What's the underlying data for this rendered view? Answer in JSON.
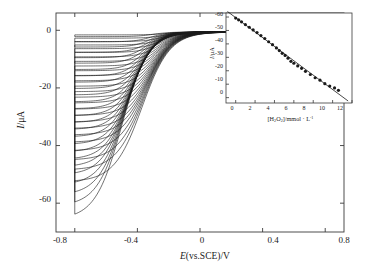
{
  "figure": {
    "kind": "cyclic-voltammogram-with-inset-calibration",
    "background": "#ffffff",
    "line_color": "#1a1a1a",
    "axis_color": "#3a3a3a"
  },
  "main_axes": {
    "xlabel_parts": {
      "italic": "E",
      "rest": "(vs.SCE)/V"
    },
    "ylabel_parts": {
      "italic": "I",
      "rest": "/μA"
    },
    "x_ticks": [
      "-0.8",
      "-0.4",
      "0",
      "0.4",
      "0.8"
    ],
    "x_tick_values": [
      -0.8,
      -0.4,
      0,
      0.4,
      0.8
    ],
    "y_ticks": [
      "0",
      "-20",
      "-40",
      "-60"
    ],
    "y_tick_values": [
      0,
      -20,
      -40,
      -60
    ],
    "xlim": [
      -0.92,
      0.92
    ],
    "ylim": [
      -70,
      6
    ],
    "grid": false,
    "frame": "box"
  },
  "inset_axes": {
    "xlabel_parts": {
      "pre": "[H",
      "sub1": "2",
      "mid": "O",
      "sub2": "2",
      "post": "]/mmol · L",
      "sup": "-1"
    },
    "ylabel_parts": {
      "italic": "I",
      "rest": "/μA"
    },
    "x_ticks": [
      "0",
      "2",
      "4",
      "6",
      "8",
      "10",
      "12"
    ],
    "x_tick_values": [
      0,
      2,
      4,
      6,
      8,
      10,
      12
    ],
    "y_ticks": [
      "0",
      "-10",
      "-20",
      "-30",
      "-40",
      "-50",
      "-60"
    ],
    "y_tick_values": [
      0,
      -10,
      -20,
      -30,
      -40,
      -50,
      -60
    ],
    "xlim": [
      -1.0,
      12.0
    ],
    "ylim": [
      -64,
      3
    ],
    "grid": false,
    "frame": "box"
  },
  "chart_data": [
    {
      "type": "line",
      "name": "cyclic-voltammograms",
      "title": "",
      "xlabel": "E(vs.SCE)/V",
      "ylabel": "I/μA",
      "xlim": [
        -0.92,
        0.92
      ],
      "ylim": [
        -70,
        6
      ],
      "grid": false,
      "legend": "none",
      "description": "Overlaid cyclic voltammetry curves of increasing cathodic peak current with successive additions of H2O2; each curve is a closed loop scanned from +0.85 V to -0.8 V and back.",
      "n_curves": 26,
      "scan_start_v": 0.85,
      "scan_switch_v": -0.8,
      "curve_peak_currents_ua": [
        -1.6,
        -3.4,
        -5.2,
        -7.0,
        -8.9,
        -10.8,
        -13.0,
        -15.2,
        -17.4,
        -19.6,
        -21.8,
        -24.2,
        -26.6,
        -29.0,
        -31.4,
        -33.8,
        -36.4,
        -39.0,
        -41.6,
        -44.2,
        -46.8,
        -49.6,
        -53.0,
        -56.6,
        -60.4,
        -65.0
      ],
      "baseline_current_ua": -0.6
    },
    {
      "type": "scatter",
      "name": "inset-calibration",
      "title": "",
      "xlabel": "[H2O2]/mmol · L-1",
      "ylabel": "I/μA",
      "xlim": [
        -1.0,
        12.0
      ],
      "ylim": [
        -64,
        3
      ],
      "grid": false,
      "legend": "none",
      "description": "Linear calibration of cathodic peak current versus hydrogen peroxide concentration, with least-squares fit line.",
      "x": [
        0.0,
        0.3,
        0.6,
        1.0,
        1.4,
        1.8,
        2.2,
        2.6,
        3.0,
        3.4,
        3.8,
        4.2,
        4.5,
        4.8,
        5.1,
        5.4,
        5.7,
        6.0,
        6.4,
        6.8,
        7.2,
        7.7,
        8.2,
        8.7,
        9.2,
        9.7,
        10.2,
        10.6
      ],
      "y": [
        -0.8,
        -2.1,
        -3.6,
        -5.6,
        -7.6,
        -9.6,
        -11.6,
        -13.8,
        -16.0,
        -18.4,
        -20.6,
        -23.0,
        -25.0,
        -27.0,
        -28.6,
        -30.6,
        -33.0,
        -34.4,
        -36.4,
        -38.2,
        -40.4,
        -42.8,
        -45.2,
        -47.0,
        -49.6,
        -51.4,
        -52.8,
        -54.6
      ],
      "fit_line": {
        "slope": -5.35,
        "intercept": -0.45,
        "x_from": -0.85,
        "x_to": 11.6
      }
    }
  ]
}
